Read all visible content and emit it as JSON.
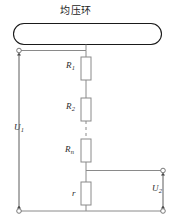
{
  "figure": {
    "type": "circuit-diagram",
    "title": "均压环",
    "background": "#ffffff",
    "line_color": "#6e6e6e",
    "ring_color": "#1a1a1a",
    "text_color": "#2b2b2b"
  },
  "labels": {
    "title": "均压环",
    "r1": "R",
    "r1_sub": "1",
    "r2": "R",
    "r2_sub": "2",
    "rn": "R",
    "rn_sub": "n",
    "r_small": "r",
    "u1": "U",
    "u1_sub": "1",
    "u2": "U",
    "u2_sub": "2"
  },
  "components": {
    "ring": {
      "name": "equalizing-ring",
      "shape": "stadium",
      "label": "均压环"
    },
    "resistors": [
      {
        "name": "R1",
        "label": "R",
        "sub": "1"
      },
      {
        "name": "R2",
        "label": "R",
        "sub": "2"
      },
      {
        "name": "Rn",
        "label": "R",
        "sub": "n"
      },
      {
        "name": "r",
        "label": "r",
        "sub": ""
      }
    ],
    "dashed_gap": {
      "name": "series-continuation",
      "style": "dashed"
    },
    "terminals": [
      {
        "name": "top-left-terminal",
        "style": "open-circle"
      },
      {
        "name": "bottom-left-terminal",
        "style": "open-circle"
      },
      {
        "name": "top-right-terminal",
        "style": "open-circle"
      },
      {
        "name": "bottom-right-terminal",
        "style": "open-circle"
      }
    ],
    "voltages": [
      {
        "name": "U1",
        "label": "U",
        "sub": "1",
        "arrows": "double-headed-vertical"
      },
      {
        "name": "U2",
        "label": "U",
        "sub": "2",
        "arrows": "double-headed-vertical"
      }
    ]
  }
}
